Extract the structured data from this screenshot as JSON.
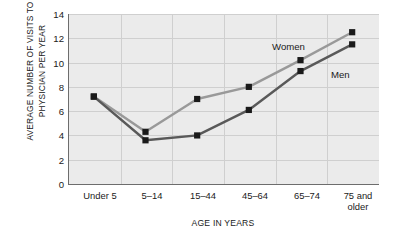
{
  "chart_data": {
    "type": "line",
    "title": "",
    "xlabel": "AGE IN YEARS",
    "ylabel": "AVERAGE NUMBER OF VISITS TO PHYSICIAN PER YEAR",
    "categories": [
      "Under 5",
      "5–14",
      "15–44",
      "45–64",
      "65–74",
      "75 and older"
    ],
    "ylim": [
      0,
      14
    ],
    "yticks": [
      0,
      2,
      4,
      6,
      8,
      10,
      12,
      14
    ],
    "grid": true,
    "legend_position": "inline-annotation",
    "series": [
      {
        "name": "Women",
        "color": "#999999",
        "marker": "square",
        "marker_color": "#1a1a1a",
        "values": [
          7.2,
          4.3,
          7.0,
          8.0,
          10.2,
          12.5
        ]
      },
      {
        "name": "Men",
        "color": "#595959",
        "marker": "square",
        "marker_color": "#1a1a1a",
        "values": [
          7.2,
          3.6,
          4.0,
          6.1,
          9.3,
          11.5
        ]
      }
    ],
    "annotations": [
      {
        "text": "Women",
        "series": "Women"
      },
      {
        "text": "Men",
        "series": "Men"
      }
    ],
    "plot_background": "#ebebeb",
    "axis_color": "#6d6d6d",
    "gridline_color": "#cfcfcf"
  },
  "ylabels": {
    "t0": "0",
    "t1": "2",
    "t2": "4",
    "t3": "6",
    "t4": "8",
    "t5": "10",
    "t6": "12",
    "t7": "14"
  },
  "xlabels": {
    "c0": "Under 5",
    "c1": "5–14",
    "c2": "15–44",
    "c3": "45–64",
    "c4a": "75 and",
    "c4b": "older",
    "c5": "65–74"
  },
  "titles": {
    "y_axis": "AVERAGE NUMBER OF VISITS TO PHYSICIAN PER YEAR",
    "x_axis": "AGE IN YEARS"
  },
  "labels": {
    "women": "Women",
    "men": "Men"
  }
}
